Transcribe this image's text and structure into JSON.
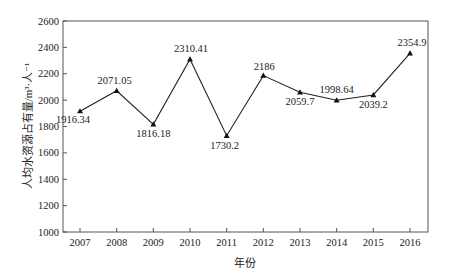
{
  "chart_data": {
    "type": "line",
    "title": "",
    "xlabel": "年份",
    "ylabel": "人均水资源占有量/m³·人⁻¹",
    "categories": [
      "2007",
      "2008",
      "2009",
      "2010",
      "2011",
      "2012",
      "2013",
      "2014",
      "2015",
      "2016"
    ],
    "series": [
      {
        "name": "人均水资源占有量",
        "values": [
          1916.34,
          2071.05,
          1816.18,
          2310.41,
          1730.2,
          2186,
          2059.7,
          1998.64,
          2039.2,
          2354.9
        ],
        "labels": [
          "1916.34",
          "2071.05",
          "1816.18",
          "2310.41",
          "1730.2",
          "2186",
          "2059.7",
          "1998.64",
          "2039.2",
          "2354.9"
        ],
        "marker": "triangle",
        "color": "#222222"
      }
    ],
    "ylim": [
      1000,
      2600
    ],
    "yticks": [
      1000,
      1200,
      1400,
      1600,
      1800,
      2000,
      2200,
      2400,
      2600
    ],
    "grid": false,
    "legend": "none"
  }
}
